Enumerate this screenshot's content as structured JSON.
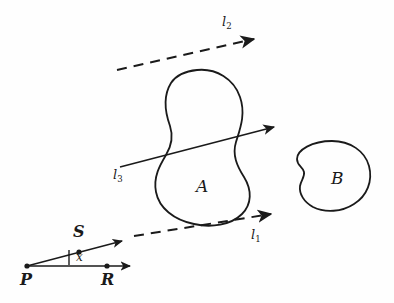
{
  "figure": {
    "background_color": "#fefefe",
    "ink_color": "#1a1a1a",
    "width": 394,
    "height": 303
  },
  "regions": [
    {
      "id": "A",
      "label": "A",
      "label_x": 196,
      "label_y": 178,
      "description": "peanut-shaped closed curve with narrow waist"
    },
    {
      "id": "B",
      "label": "B",
      "label_x": 331,
      "label_y": 170,
      "description": "rounded closed curve with small concave notch on left"
    }
  ],
  "lines": [
    {
      "id": "l1",
      "base": "l",
      "subscript": "1",
      "style": "dashed",
      "label_x": 251,
      "label_y": 228,
      "arrow": "right",
      "from_x": 133,
      "from_y": 236,
      "to_x": 283,
      "to_y": 212
    },
    {
      "id": "l2",
      "base": "l",
      "subscript": "2",
      "style": "dashed",
      "label_x": 222,
      "label_y": 15,
      "arrow": "right",
      "from_x": 117,
      "from_y": 70,
      "to_x": 267,
      "to_y": 36
    },
    {
      "id": "l3",
      "base": "l",
      "subscript": "3",
      "style": "solid",
      "label_x": 113,
      "label_y": 168,
      "arrow": "right",
      "from_x": 120,
      "from_y": 168,
      "to_x": 284,
      "to_y": 125
    }
  ],
  "points": [
    {
      "id": "P",
      "label": "P",
      "x": 27,
      "y": 266,
      "label_x": 20,
      "label_y": 272
    },
    {
      "id": "S",
      "label": "S",
      "x": 79,
      "y": 247,
      "label_x": 73,
      "label_y": 224
    },
    {
      "id": "R",
      "label": "R",
      "x": 107,
      "y": 266,
      "label_x": 101,
      "label_y": 272
    }
  ],
  "rays": [
    {
      "id": "ray-PS",
      "from": "P",
      "through": "S",
      "style": "solid",
      "arrow": "right",
      "from_x": 27,
      "from_y": 266,
      "to_x": 130,
      "to_y": 239
    },
    {
      "id": "ray-PR",
      "from": "P",
      "through": "R",
      "style": "solid",
      "arrow": "right",
      "from_x": 27,
      "from_y": 266,
      "to_x": 138,
      "to_y": 266
    }
  ],
  "angle": {
    "id": "x",
    "label": "x",
    "label_x": 76,
    "label_y": 251,
    "tick_x": 69,
    "tick_y_top": 250,
    "tick_y_bottom": 265,
    "description": "vertical tick marking angle x between ray PS and ray PR"
  }
}
